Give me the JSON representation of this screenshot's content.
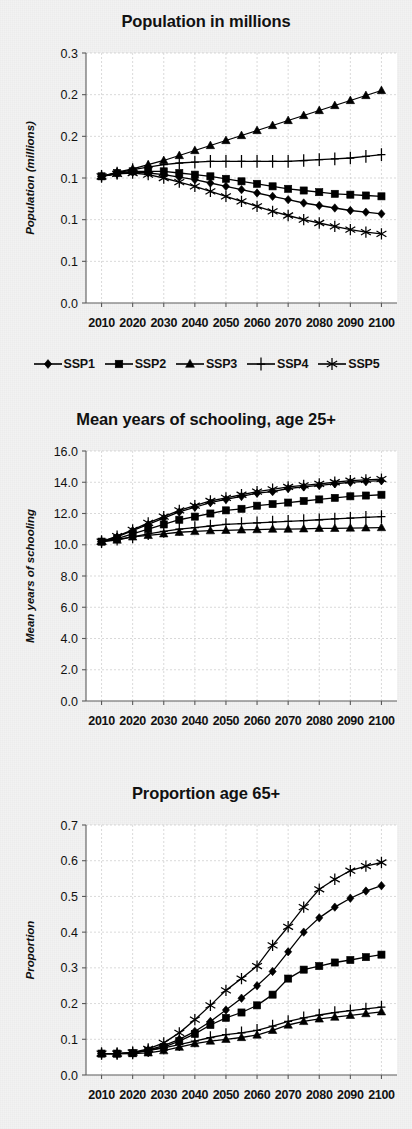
{
  "figure": {
    "background_color": "#f2f2f2",
    "ink_color": "#000000",
    "plot_background": "#ffffff",
    "gridline_color": "#c9c9c9"
  },
  "legend": {
    "items": [
      {
        "label": "SSP1",
        "marker": "diamond"
      },
      {
        "label": "SSP2",
        "marker": "square"
      },
      {
        "label": "SSP3",
        "marker": "triangle"
      },
      {
        "label": "SSP4",
        "marker": "plus"
      },
      {
        "label": "SSP5",
        "marker": "asterisk"
      }
    ]
  },
  "chart_data": [
    {
      "id": "population",
      "type": "line",
      "title": "Population in millions",
      "xlabel": "",
      "ylabel": "Population (millions)",
      "x": [
        2010,
        2015,
        2020,
        2025,
        2030,
        2035,
        2040,
        2045,
        2050,
        2055,
        2060,
        2065,
        2070,
        2075,
        2080,
        2085,
        2090,
        2095,
        2100
      ],
      "xlim": [
        2005,
        2105
      ],
      "xticks": [
        2010,
        2020,
        2030,
        2040,
        2050,
        2060,
        2070,
        2080,
        2090,
        2100
      ],
      "xtick_labels": [
        "2010",
        "2020",
        "2030",
        "2040",
        "2050",
        "2060",
        "2070",
        "2080",
        "2090",
        "2100"
      ],
      "ylim": [
        0.0,
        0.3
      ],
      "yticks": [
        0.0,
        0.05,
        0.1,
        0.15,
        0.2,
        0.25,
        0.3
      ],
      "ytick_labels": [
        "0.0",
        "0.1",
        "0.1",
        "0.1",
        "0.2",
        "0.2",
        "0.3"
      ],
      "grid": true,
      "legend_position": "bottom",
      "series": [
        {
          "name": "SSP1",
          "marker": "diamond",
          "values": [
            0.152,
            0.155,
            0.157,
            0.156,
            0.154,
            0.151,
            0.148,
            0.144,
            0.14,
            0.136,
            0.132,
            0.128,
            0.124,
            0.12,
            0.117,
            0.114,
            0.111,
            0.109,
            0.107
          ]
        },
        {
          "name": "SSP2",
          "marker": "square",
          "values": [
            0.152,
            0.156,
            0.158,
            0.158,
            0.158,
            0.156,
            0.154,
            0.152,
            0.149,
            0.146,
            0.143,
            0.14,
            0.137,
            0.135,
            0.133,
            0.131,
            0.13,
            0.129,
            0.128
          ]
        },
        {
          "name": "SSP3",
          "marker": "triangle",
          "values": [
            0.152,
            0.157,
            0.161,
            0.166,
            0.171,
            0.177,
            0.183,
            0.189,
            0.195,
            0.201,
            0.207,
            0.213,
            0.219,
            0.225,
            0.231,
            0.237,
            0.243,
            0.249,
            0.255
          ]
        },
        {
          "name": "SSP4",
          "marker": "plus",
          "values": [
            0.152,
            0.156,
            0.16,
            0.163,
            0.166,
            0.168,
            0.169,
            0.17,
            0.17,
            0.17,
            0.17,
            0.17,
            0.17,
            0.171,
            0.172,
            0.173,
            0.174,
            0.176,
            0.178
          ]
        },
        {
          "name": "SSP5",
          "marker": "asterisk",
          "values": [
            0.152,
            0.155,
            0.156,
            0.154,
            0.15,
            0.145,
            0.14,
            0.134,
            0.128,
            0.122,
            0.116,
            0.11,
            0.105,
            0.1,
            0.096,
            0.092,
            0.088,
            0.085,
            0.083
          ]
        }
      ]
    },
    {
      "id": "schooling",
      "type": "line",
      "title": "Mean years of schooling, age 25+",
      "xlabel": "",
      "ylabel": "Mean years of schooling",
      "x": [
        2010,
        2015,
        2020,
        2025,
        2030,
        2035,
        2040,
        2045,
        2050,
        2055,
        2060,
        2065,
        2070,
        2075,
        2080,
        2085,
        2090,
        2095,
        2100
      ],
      "xlim": [
        2005,
        2105
      ],
      "xticks": [
        2010,
        2020,
        2030,
        2040,
        2050,
        2060,
        2070,
        2080,
        2090,
        2100
      ],
      "xtick_labels": [
        "2010",
        "2020",
        "2030",
        "2040",
        "2050",
        "2060",
        "2070",
        "2080",
        "2090",
        "2100"
      ],
      "ylim": [
        0.0,
        16.0
      ],
      "yticks": [
        0.0,
        2.0,
        4.0,
        6.0,
        8.0,
        10.0,
        12.0,
        14.0,
        16.0
      ],
      "ytick_labels": [
        "0.0",
        "2.0",
        "4.0",
        "6.0",
        "8.0",
        "10.0",
        "12.0",
        "14.0",
        "16.0"
      ],
      "grid": true,
      "legend_position": "none",
      "series": [
        {
          "name": "SSP1",
          "marker": "diamond",
          "values": [
            10.2,
            10.5,
            10.9,
            11.3,
            11.7,
            12.1,
            12.4,
            12.7,
            12.9,
            13.1,
            13.3,
            13.4,
            13.6,
            13.7,
            13.8,
            13.9,
            14.0,
            14.05,
            14.1
          ]
        },
        {
          "name": "SSP2",
          "marker": "square",
          "values": [
            10.2,
            10.4,
            10.7,
            11.0,
            11.3,
            11.6,
            11.8,
            12.0,
            12.2,
            12.3,
            12.5,
            12.6,
            12.7,
            12.8,
            12.9,
            13.0,
            13.1,
            13.15,
            13.2
          ]
        },
        {
          "name": "SSP3",
          "marker": "triangle",
          "values": [
            10.2,
            10.3,
            10.5,
            10.6,
            10.7,
            10.8,
            10.85,
            10.9,
            10.92,
            10.95,
            10.97,
            11.0,
            11.0,
            11.02,
            11.05,
            11.05,
            11.07,
            11.08,
            11.1
          ]
        },
        {
          "name": "SSP4",
          "marker": "plus",
          "values": [
            10.2,
            10.35,
            10.5,
            10.7,
            10.85,
            11.0,
            11.1,
            11.2,
            11.3,
            11.35,
            11.4,
            11.45,
            11.5,
            11.55,
            11.6,
            11.65,
            11.7,
            11.75,
            11.8
          ]
        },
        {
          "name": "SSP5",
          "marker": "asterisk",
          "values": [
            10.2,
            10.55,
            10.95,
            11.4,
            11.8,
            12.2,
            12.5,
            12.8,
            13.0,
            13.2,
            13.4,
            13.55,
            13.7,
            13.8,
            13.9,
            14.0,
            14.1,
            14.15,
            14.2
          ]
        }
      ]
    },
    {
      "id": "age65",
      "type": "line",
      "title": "Proportion age 65+",
      "xlabel": "",
      "ylabel": "Proportion",
      "x": [
        2010,
        2015,
        2020,
        2025,
        2030,
        2035,
        2040,
        2045,
        2050,
        2055,
        2060,
        2065,
        2070,
        2075,
        2080,
        2085,
        2090,
        2095,
        2100
      ],
      "xlim": [
        2005,
        2105
      ],
      "xticks": [
        2010,
        2020,
        2030,
        2040,
        2050,
        2060,
        2070,
        2080,
        2090,
        2100
      ],
      "xtick_labels": [
        "2010",
        "2020",
        "2030",
        "2040",
        "2050",
        "2060",
        "2070",
        "2080",
        "2090",
        "2100"
      ],
      "ylim": [
        0.0,
        0.7
      ],
      "yticks": [
        0.0,
        0.1,
        0.2,
        0.3,
        0.4,
        0.5,
        0.6,
        0.7
      ],
      "ytick_labels": [
        "0.0",
        "0.1",
        "0.2",
        "0.3",
        "0.4",
        "0.5",
        "0.6",
        "0.7"
      ],
      "grid": true,
      "legend_position": "none",
      "series": [
        {
          "name": "SSP1",
          "marker": "diamond",
          "values": [
            0.06,
            0.06,
            0.062,
            0.07,
            0.082,
            0.1,
            0.122,
            0.15,
            0.182,
            0.215,
            0.25,
            0.29,
            0.345,
            0.4,
            0.44,
            0.47,
            0.495,
            0.515,
            0.53
          ]
        },
        {
          "name": "SSP2",
          "marker": "square",
          "values": [
            0.06,
            0.06,
            0.062,
            0.068,
            0.078,
            0.095,
            0.115,
            0.14,
            0.16,
            0.175,
            0.195,
            0.225,
            0.27,
            0.295,
            0.305,
            0.315,
            0.322,
            0.33,
            0.337
          ]
        },
        {
          "name": "SSP3",
          "marker": "triangle",
          "values": [
            0.06,
            0.059,
            0.06,
            0.062,
            0.068,
            0.078,
            0.088,
            0.095,
            0.1,
            0.105,
            0.112,
            0.125,
            0.14,
            0.15,
            0.157,
            0.162,
            0.167,
            0.172,
            0.177
          ]
        },
        {
          "name": "SSP4",
          "marker": "plus",
          "values": [
            0.06,
            0.06,
            0.062,
            0.068,
            0.076,
            0.085,
            0.095,
            0.105,
            0.113,
            0.118,
            0.125,
            0.137,
            0.15,
            0.16,
            0.168,
            0.175,
            0.18,
            0.185,
            0.19
          ]
        },
        {
          "name": "SSP5",
          "marker": "asterisk",
          "values": [
            0.06,
            0.06,
            0.063,
            0.073,
            0.09,
            0.118,
            0.155,
            0.195,
            0.237,
            0.27,
            0.305,
            0.363,
            0.415,
            0.47,
            0.52,
            0.548,
            0.572,
            0.585,
            0.595
          ]
        }
      ]
    }
  ]
}
